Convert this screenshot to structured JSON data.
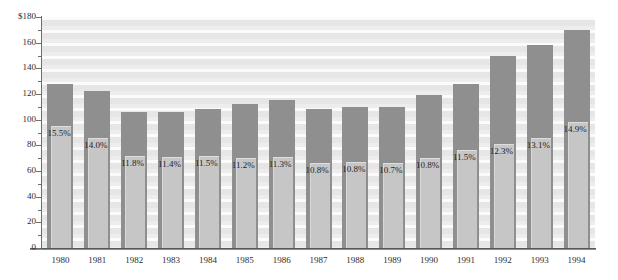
{
  "title_faint": "",
  "chart_data": {
    "type": "bar",
    "title": "",
    "subtitle": "",
    "xlabel": "",
    "ylabel": "",
    "ylim": [
      0,
      180
    ],
    "ytick_step": 20,
    "yminor_step": 10,
    "grid": true,
    "legend_position": "none",
    "currency_prefix": "$",
    "categories": [
      "1980",
      "1981",
      "1982",
      "1983",
      "1984",
      "1985",
      "1986",
      "1987",
      "1988",
      "1989",
      "1990",
      "1991",
      "1992",
      "1993",
      "1994"
    ],
    "ytick_labels": [
      "$180",
      "160",
      "140",
      "120",
      "100",
      "80",
      "60",
      "40",
      "20",
      "0"
    ],
    "ytick_values": [
      180,
      160,
      140,
      120,
      100,
      80,
      60,
      40,
      20,
      0
    ],
    "series": [
      {
        "name": "Total",
        "values": [
          128,
          122,
          106,
          106,
          108,
          112,
          115,
          108,
          110,
          110,
          119,
          128,
          150,
          158,
          170
        ]
      },
      {
        "name": "Subset",
        "values": [
          95,
          86,
          72,
          71,
          72,
          70,
          71,
          66,
          67,
          66,
          70,
          76,
          81,
          86,
          98
        ]
      }
    ],
    "point_labels": [
      "15.5%",
      "14.0%",
      "11.8%",
      "11.4%",
      "11.5%",
      "11.2%",
      "11.3%",
      "10.8%",
      "10.8%",
      "10.7%",
      "10.8%",
      "11.5%",
      "12.3%",
      "13.1%",
      "14.9%"
    ],
    "colors": {
      "outer_bar": "#8f8f8f",
      "inner_bar": "#c6c6c6",
      "plot_background": "#e9e9e9",
      "stripe": "#fbfbfb",
      "axis": "#5a5a5a",
      "text": "#2c2c2c"
    }
  }
}
